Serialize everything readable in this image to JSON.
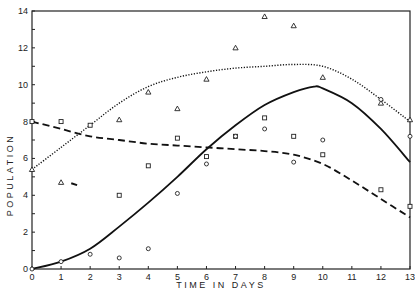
{
  "chart_data": {
    "type": "line",
    "title": "",
    "xlabel": "TIME IN DAYS",
    "ylabel": "POPULATION",
    "xlim": [
      0,
      13
    ],
    "ylim": [
      0,
      14
    ],
    "x_ticks": [
      0,
      1,
      2,
      3,
      4,
      5,
      6,
      7,
      8,
      9,
      10,
      11,
      12,
      13
    ],
    "y_ticks": [
      0,
      2,
      4,
      6,
      8,
      10,
      12,
      14
    ],
    "grid": false,
    "legend": "none",
    "series": [
      {
        "name": "triangles",
        "marker": "triangle",
        "points": [
          [
            0,
            5.4
          ],
          [
            1,
            4.7
          ],
          [
            3,
            8.1
          ],
          [
            4,
            9.6
          ],
          [
            5,
            8.7
          ],
          [
            6,
            10.3
          ],
          [
            7,
            12.0
          ],
          [
            8,
            13.7
          ],
          [
            9,
            13.2
          ],
          [
            10,
            10.4
          ],
          [
            12,
            9.0
          ],
          [
            13,
            8.1
          ]
        ],
        "fit_style": "dotted",
        "fit": [
          [
            0,
            5.4
          ],
          [
            1,
            6.6
          ],
          [
            2,
            7.8
          ],
          [
            3,
            9.0
          ],
          [
            4,
            9.9
          ],
          [
            5,
            10.4
          ],
          [
            6,
            10.7
          ],
          [
            7,
            10.9
          ],
          [
            8,
            11.0
          ],
          [
            9,
            11.1
          ],
          [
            10,
            11.0
          ],
          [
            11,
            10.3
          ],
          [
            12,
            9.2
          ],
          [
            13,
            8.0
          ]
        ]
      },
      {
        "name": "squares",
        "marker": "square",
        "points": [
          [
            0,
            8.0
          ],
          [
            1,
            8.0
          ],
          [
            2,
            7.8
          ],
          [
            3,
            4.0
          ],
          [
            4,
            5.6
          ],
          [
            5,
            7.1
          ],
          [
            6,
            6.1
          ],
          [
            7,
            7.2
          ],
          [
            8,
            8.2
          ],
          [
            9,
            7.2
          ],
          [
            10,
            6.2
          ],
          [
            12,
            4.3
          ],
          [
            13,
            3.4
          ]
        ],
        "fit_style": "dashed",
        "fit": [
          [
            0,
            8.0
          ],
          [
            1,
            7.6
          ],
          [
            2,
            7.2
          ],
          [
            3,
            7.0
          ],
          [
            4,
            6.8
          ],
          [
            5,
            6.7
          ],
          [
            6,
            6.6
          ],
          [
            7,
            6.5
          ],
          [
            8,
            6.4
          ],
          [
            9,
            6.2
          ],
          [
            10,
            5.7
          ],
          [
            11,
            4.8
          ],
          [
            12,
            3.8
          ],
          [
            13,
            2.8
          ]
        ]
      },
      {
        "name": "circles",
        "marker": "circle",
        "points": [
          [
            0,
            0
          ],
          [
            1,
            0.4
          ],
          [
            2,
            0.8
          ],
          [
            3,
            0.6
          ],
          [
            4,
            1.1
          ],
          [
            5,
            4.1
          ],
          [
            6,
            5.7
          ],
          [
            7,
            7.2
          ],
          [
            8,
            7.6
          ],
          [
            9,
            5.8
          ],
          [
            10,
            7.0
          ],
          [
            12,
            9.2
          ],
          [
            13,
            7.2
          ]
        ],
        "fit_style": "solid",
        "fit": [
          [
            0,
            0
          ],
          [
            1,
            0.4
          ],
          [
            2,
            1.1
          ],
          [
            3,
            2.3
          ],
          [
            4,
            3.6
          ],
          [
            5,
            5.0
          ],
          [
            6,
            6.5
          ],
          [
            7,
            7.8
          ],
          [
            8,
            8.9
          ],
          [
            9,
            9.6
          ],
          [
            9.7,
            9.9
          ],
          [
            10,
            9.8
          ],
          [
            11,
            9.0
          ],
          [
            12,
            7.6
          ],
          [
            13,
            5.8
          ]
        ]
      }
    ]
  }
}
